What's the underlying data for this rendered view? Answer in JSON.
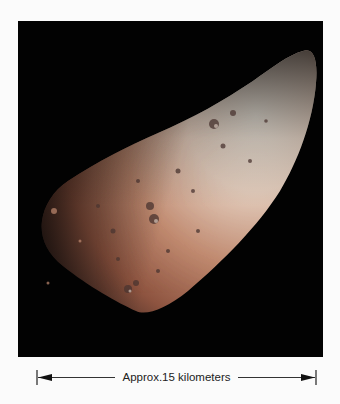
{
  "figure": {
    "background_color": "#020202",
    "page_color": "#fbfbfb",
    "surface_colors": {
      "highlight": "#efe6da",
      "midtone": "#c99a82",
      "reddish": "#9a5a44",
      "shadow": "#3a2620"
    }
  },
  "scale_bar": {
    "label": "Approx.15 kilometers",
    "arrow_color": "#222222"
  }
}
